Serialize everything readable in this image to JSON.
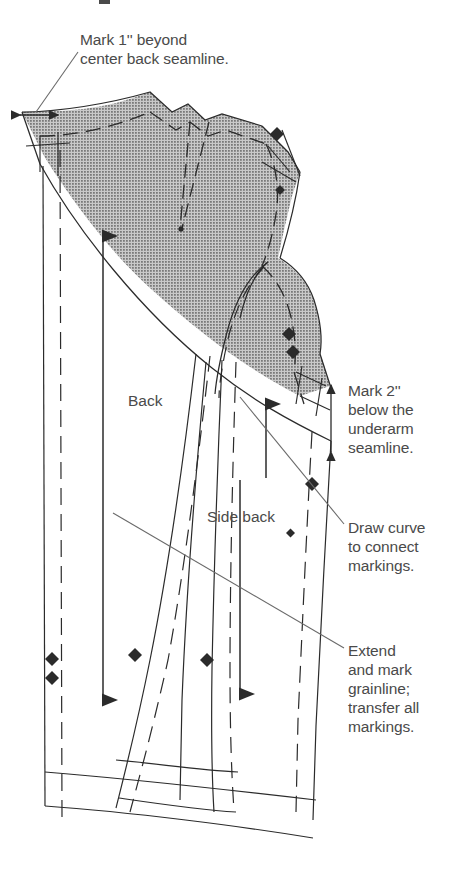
{
  "figure": {
    "type": "sewing-pattern-diagram",
    "page_background": "#ffffff",
    "ink_color": "#2b2b2b",
    "shade_fill": "#a9a9a9",
    "text_color": "#4a4a4a"
  },
  "annotations": [
    {
      "id": "mark-1-inch",
      "text": "Mark 1'' beyond\ncenter back seamline.",
      "x": 80,
      "y": 30,
      "leader_from": [
        78,
        52
      ],
      "leader_to": [
        36,
        112
      ],
      "measure": "1 inch",
      "measure_arrow": "horizontal-double"
    },
    {
      "id": "mark-2-inch",
      "text": "Mark 2''\nbelow the\nunderarm\nseamline.",
      "x": 348,
      "y": 381,
      "measure": "2 inches",
      "measure_arrow": "vertical-double"
    },
    {
      "id": "draw-curve",
      "text": "Draw curve\nto connect\nmarkings.",
      "x": 348,
      "y": 518,
      "leader_from": [
        344,
        524
      ],
      "leader_to": [
        240,
        397
      ]
    },
    {
      "id": "extend-grainline",
      "text": "Extend\nand mark\ngrainline;\ntransfer all\nmarkings.",
      "x": 348,
      "y": 641,
      "leader_from": [
        344,
        648
      ],
      "leader_to": [
        113,
        513
      ]
    }
  ],
  "part_labels": [
    {
      "id": "back",
      "text": "Back",
      "x": 128,
      "y": 392
    },
    {
      "id": "side-back",
      "text": "Side back",
      "x": 207,
      "y": 508
    }
  ],
  "markings": {
    "grainline_arrows": 5,
    "notch_diamonds": 7,
    "dart_count": 1,
    "seam_allowance_lines": "dashed",
    "cutting_lines": "solid"
  },
  "colors": {
    "shade": "#a9a9a9",
    "line": "#2b2b2b",
    "text": "#4a4a4a",
    "background": "#ffffff"
  }
}
